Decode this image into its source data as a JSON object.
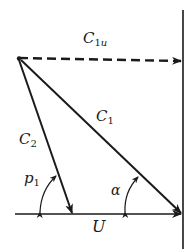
{
  "diagram": {
    "type": "velocity-triangle",
    "stroke_color": "#1a1a1a",
    "background": "#ffffff",
    "labels": {
      "c1u": {
        "main": "C",
        "sub": "1",
        "sub_italic": "u"
      },
      "c1": {
        "main": "C",
        "sub": "1"
      },
      "c2": {
        "main": "C",
        "sub": "2"
      },
      "p1": {
        "main": "p",
        "sub": "1"
      },
      "alpha": {
        "main": "α"
      },
      "u": {
        "main": "U"
      }
    },
    "vectors": [
      {
        "name": "C1u",
        "style": "dashed",
        "from": [
          18,
          58
        ],
        "to": [
          181,
          61
        ]
      },
      {
        "name": "C1",
        "style": "solid",
        "from": [
          18,
          58
        ],
        "to": [
          181,
          214
        ]
      },
      {
        "name": "C2",
        "style": "solid",
        "from": [
          18,
          58
        ],
        "to": [
          72,
          214
        ]
      },
      {
        "name": "U",
        "style": "solid",
        "from": [
          15,
          214
        ],
        "to": [
          181,
          214
        ]
      }
    ],
    "reference_line": {
      "x": 183,
      "y1": 10,
      "y2": 249
    },
    "angles": [
      "p1",
      "α"
    ]
  }
}
